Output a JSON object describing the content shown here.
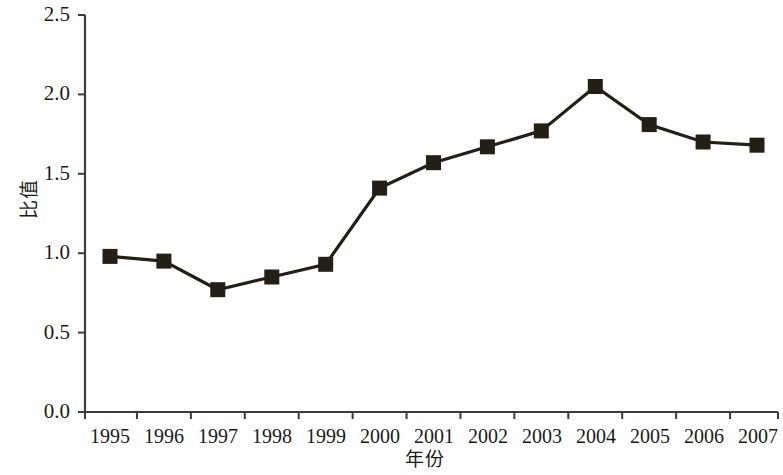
{
  "chart_data": {
    "type": "line",
    "title": "",
    "subtitle": "",
    "xlabel": "年份",
    "ylabel": "比值",
    "categories": [
      "1995",
      "1996",
      "1997",
      "1998",
      "1999",
      "2000",
      "2001",
      "2002",
      "2003",
      "2004",
      "2005",
      "2006",
      "2007"
    ],
    "x": [
      1995,
      1996,
      1997,
      1998,
      1999,
      2000,
      2001,
      2002,
      2003,
      2004,
      2005,
      2006,
      2007
    ],
    "values": [
      0.98,
      0.95,
      0.77,
      0.85,
      0.93,
      1.41,
      1.57,
      1.67,
      1.77,
      2.05,
      1.81,
      1.7,
      1.68
    ],
    "series": [
      {
        "name": "比值",
        "values": [
          0.98,
          0.95,
          0.77,
          0.85,
          0.93,
          1.41,
          1.57,
          1.67,
          1.77,
          2.05,
          1.81,
          1.7,
          1.68
        ],
        "color": "#231f16",
        "marker": "square"
      }
    ],
    "ylim": [
      0.0,
      2.5
    ],
    "ytick_labels": [
      "0.0",
      "0.5",
      "1.0",
      "1.5",
      "2.0",
      "2.5"
    ],
    "ytick_values": [
      0.0,
      0.5,
      1.0,
      1.5,
      2.0,
      2.5
    ],
    "grid": false,
    "legend": null,
    "legend_position": "none",
    "annotations": []
  },
  "axis": {
    "line_color": "#3c3c3c",
    "series_color": "#231f16"
  }
}
